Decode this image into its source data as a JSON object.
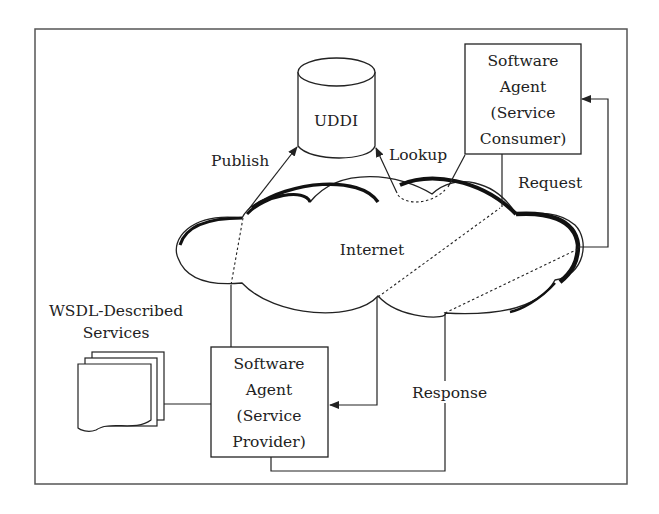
{
  "diagram": {
    "registry": {
      "label": "UDDI"
    },
    "network": {
      "label": "Internet"
    },
    "consumer": {
      "lines": [
        "Software",
        "Agent",
        "(Service",
        "Consumer)"
      ]
    },
    "provider": {
      "lines": [
        "Software",
        "Agent",
        "(Service",
        "Provider)"
      ]
    },
    "services": {
      "lines": [
        "WSDL-Described",
        "Services"
      ]
    },
    "edges": {
      "publish": "Publish",
      "lookup": "Lookup",
      "request": "Request",
      "response": "Response"
    }
  }
}
